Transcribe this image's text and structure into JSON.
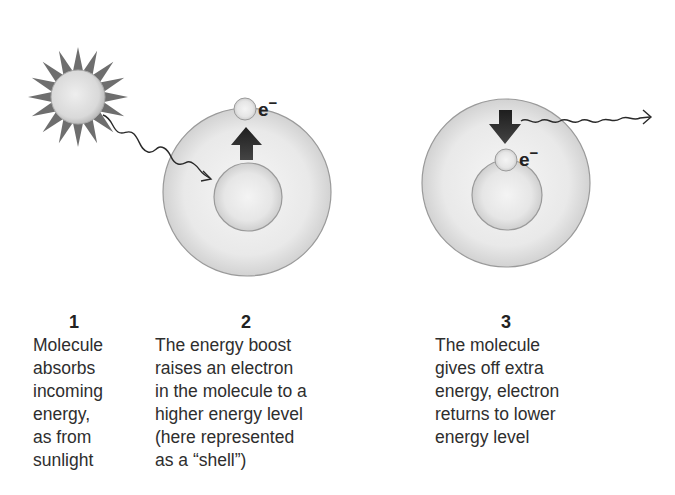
{
  "diagram": {
    "electron_symbol": "e",
    "electron_charge": "−",
    "steps": [
      {
        "number": "1",
        "caption_lines": [
          "Molecule",
          "absorbs",
          "incoming",
          "energy,",
          "as from",
          "sunlight"
        ]
      },
      {
        "number": "2",
        "caption_lines": [
          "The energy boost",
          "raises an electron",
          "in the molecule to a",
          "higher energy level",
          "(here represented",
          "as a “shell”)"
        ]
      },
      {
        "number": "3",
        "caption_lines": [
          "The molecule",
          "gives off extra",
          "energy, electron",
          "returns to lower",
          "energy level"
        ]
      }
    ],
    "icons": {
      "sun": "sun-icon",
      "incoming_energy": "wavy-arrow-icon",
      "up_arrow": "arrow-up-icon",
      "down_arrow": "arrow-down-icon",
      "emitted_energy": "wavy-arrow-icon"
    },
    "colors": {
      "sphere_light": "#f2f2f2",
      "sphere_edge": "#9a9a9a",
      "sun_rays": "#6e6e6e",
      "arrow": "#2a2a2a",
      "text": "#2e2e2e"
    }
  }
}
